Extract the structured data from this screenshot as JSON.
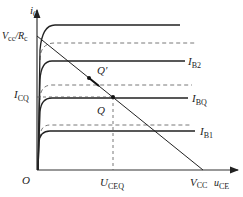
{
  "axes": {
    "y_label": "i",
    "y_sub": "C",
    "x_label": "u",
    "x_sub": "CE",
    "origin": "O"
  },
  "labels": {
    "vcc_rc_main": "V",
    "vcc_rc_sub": "cc",
    "vcc_rc_div": "/R",
    "vcc_rc_sub2": "c",
    "icq_main": "I",
    "icq_sub": "CQ",
    "uceq_main": "U",
    "uceq_sub": "CEQ",
    "vcc_main": "V",
    "vcc_sub": "CC",
    "q": "Q",
    "q_prime": "Q′"
  },
  "curves": [
    {
      "id": "top",
      "label_main": "",
      "label_sub": "",
      "y": 25,
      "x_end": 180
    },
    {
      "id": "ib2",
      "label_main": "I",
      "label_sub": "B2",
      "y": 61,
      "x_end": 185
    },
    {
      "id": "ibq",
      "label_main": "I",
      "label_sub": "BQ",
      "y": 98,
      "x_end": 188
    },
    {
      "id": "ib1",
      "label_main": "I",
      "label_sub": "B1",
      "y": 131,
      "x_end": 195
    }
  ],
  "dashed_curves": [
    {
      "y": 43,
      "x_end": 195
    },
    {
      "y": 85,
      "x_end": 192
    },
    {
      "y": 125,
      "x_end": 190
    }
  ],
  "load_line": {
    "x1": 37,
    "y1": 36,
    "x2": 203,
    "y2": 170
  },
  "points": {
    "q": {
      "x": 113,
      "y": 97
    },
    "q_prime": {
      "x": 89,
      "y": 78
    }
  },
  "colors": {
    "ink": "#222222",
    "axis": "#333333",
    "dash": "#555555"
  }
}
